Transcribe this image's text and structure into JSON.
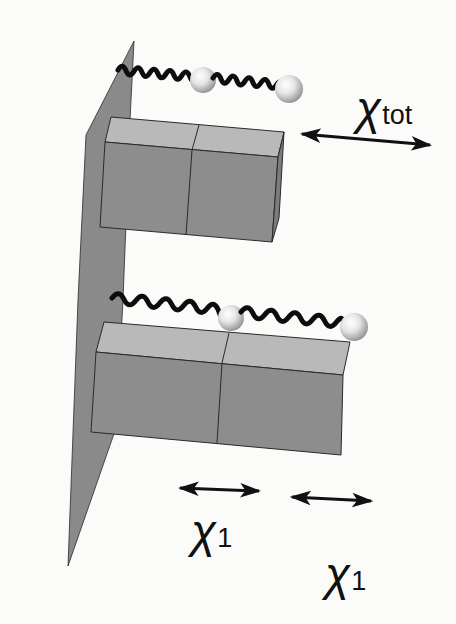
{
  "figure": {
    "colors": {
      "background": "#fbfbfa",
      "plane": "#8a8a8a",
      "block_front": "#8d8d8d",
      "block_top": "#b9b9b9",
      "block_side": "#7c7c7c",
      "edge": "#2a2a2a",
      "spring": "#0d0d0d",
      "arrow": "#111111"
    },
    "labels": {
      "upper_chi_symbol": "χ",
      "upper_chi_subscript": "tot",
      "lower_left_chi_symbol": "χ",
      "lower_left_chi_subscript": "1",
      "lower_right_chi_symbol": "χ",
      "lower_right_chi_subscript": "1"
    },
    "upper_assembly": {
      "blocks": 2,
      "springs": 2,
      "beads": 2,
      "arrow_label": "χtot"
    },
    "lower_assembly": {
      "blocks": 2,
      "springs": 2,
      "beads": 2,
      "arrow_labels": [
        "χ1",
        "χ1"
      ]
    }
  }
}
